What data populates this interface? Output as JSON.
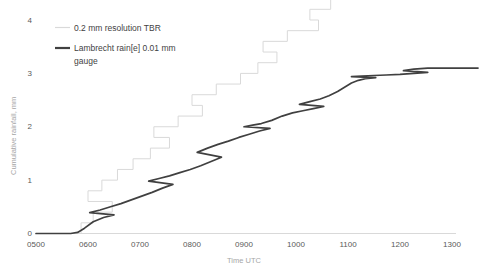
{
  "chart_data": {
    "type": "line",
    "title": "",
    "xlabel": "Time UTC",
    "ylabel": "Cumulative rainfall, mm",
    "xlim": [
      500,
      1300
    ],
    "ylim": [
      0,
      4
    ],
    "grid": false,
    "legend_position": "top-left",
    "x_tick_labels": [
      "0500",
      "0600",
      "0700",
      "0800",
      "0900",
      "1000",
      "1100",
      "1200",
      "1300"
    ],
    "x_tick_values": [
      500,
      600,
      700,
      800,
      900,
      1000,
      1100,
      1200,
      1300
    ],
    "y_tick_labels": [
      "0",
      "1",
      "2",
      "3",
      "4"
    ],
    "y_tick_values": [
      0,
      1,
      2,
      3,
      4
    ],
    "series": [
      {
        "name": "0.2 mm resolution TBR",
        "color": "#d9d9d9",
        "style": "step",
        "resolution_mm": 0.2,
        "x": [
          500,
          552,
          552,
          566,
          566,
          588,
          588,
          600,
          600,
          616,
          616,
          634,
          634,
          652,
          652,
          672,
          672,
          694,
          694,
          716,
          716,
          744,
          744,
          772,
          772,
          800,
          800,
          828,
          828,
          856,
          856,
          876,
          876,
          898,
          898,
          922,
          922,
          950,
          950,
          986,
          986,
          1016,
          1016,
          1040,
          1040,
          1058,
          1058,
          1076,
          1076,
          1110,
          1110,
          1160,
          1160,
          1220,
          1220,
          1300
        ],
        "y": [
          0,
          0,
          0.2,
          0.2,
          0.4,
          0.4,
          0.6,
          0.6,
          0.8,
          0.8,
          1.0,
          1.0,
          1.2,
          1.2,
          1.4,
          1.4,
          1.6,
          1.6,
          1.8,
          1.8,
          2.0,
          2.0,
          2.2,
          2.2,
          2.4,
          2.4,
          2.6,
          2.6,
          2.8,
          2.8,
          3.0,
          3.0,
          3.2,
          3.2,
          3.4,
          3.4,
          3.6,
          3.6,
          3.8,
          3.8,
          4.0,
          4.0,
          4.2,
          4.2,
          4.4,
          4.4,
          4.6,
          4.6,
          4.8,
          4.8,
          5.0,
          5.0,
          5.2,
          5.2,
          5.4,
          5.4
        ]
      },
      {
        "name": "Lambrecht rain[e] 0.01 mm gauge",
        "color": "#404040",
        "style": "smooth",
        "resolution_mm": 0.01,
        "x": [
          500,
          520,
          540,
          548,
          556,
          566,
          578,
          590,
          602,
          614,
          626,
          638,
          650,
          662,
          674,
          686,
          698,
          710,
          722,
          734,
          746,
          758,
          770,
          782,
          794,
          806,
          818,
          830,
          842,
          854,
          866,
          878,
          890,
          900,
          910,
          920,
          932,
          944,
          956,
          968,
          980,
          992,
          1004,
          1016,
          1028,
          1038,
          1048,
          1056,
          1064,
          1072,
          1080,
          1092,
          1104,
          1116,
          1130,
          1144,
          1160,
          1176,
          1192,
          1204,
          1216,
          1232,
          1250,
          1270,
          1290,
          1300
        ],
        "y": [
          0.0,
          0.0,
          0.0,
          0.02,
          0.1,
          0.22,
          0.3,
          0.35,
          0.39,
          0.44,
          0.5,
          0.56,
          0.63,
          0.7,
          0.77,
          0.85,
          0.92,
          0.98,
          1.03,
          1.08,
          1.14,
          1.2,
          1.27,
          1.35,
          1.43,
          1.52,
          1.6,
          1.67,
          1.73,
          1.8,
          1.86,
          1.92,
          1.97,
          2.0,
          2.03,
          2.06,
          2.12,
          2.2,
          2.26,
          2.3,
          2.34,
          2.38,
          2.42,
          2.47,
          2.52,
          2.58,
          2.66,
          2.74,
          2.82,
          2.87,
          2.9,
          2.92,
          2.94,
          2.95,
          2.96,
          2.97,
          2.98,
          3.0,
          3.02,
          3.05,
          3.08,
          3.1,
          3.1,
          3.1,
          3.1,
          3.1
        ]
      }
    ],
    "annotations": []
  },
  "axes": {
    "y_axis_title": "Cumulative rainfall, mm",
    "x_axis_title": "Time UTC"
  },
  "legend": {
    "entries": [
      {
        "label": "0.2 mm resolution TBR",
        "color": "#d9d9d9"
      },
      {
        "label": "Lambrecht rain[e] 0.01 mm gauge",
        "color": "#404040"
      }
    ],
    "entry_2_line_1": "Lambrecht rain[e] 0.01 mm",
    "entry_2_line_2": "gauge"
  },
  "colors": {
    "axis": "#d9d9d9",
    "tick_text": "#595959",
    "axis_title": "#a6a6a6",
    "series_tbr": "#d9d9d9",
    "series_gauge": "#404040",
    "background": "#ffffff"
  }
}
